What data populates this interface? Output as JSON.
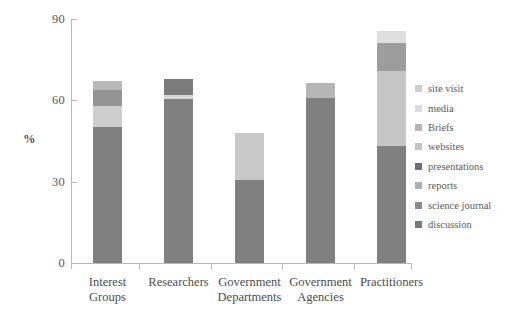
{
  "chart_data": {
    "type": "bar",
    "subtype": "stacked-bar",
    "title": "",
    "xlabel": "",
    "ylabel": "%",
    "ylim": [
      0,
      90
    ],
    "yticks": [
      0,
      30,
      60,
      90
    ],
    "ytick_labels": [
      "0",
      "30",
      "60",
      "90"
    ],
    "grid": false,
    "legend_position": "right",
    "categories": [
      "Interest Groups",
      "Researchers",
      "Government Departments",
      "Government Agencies",
      "Practitioners"
    ],
    "category_lines": [
      [
        "Interest",
        "Groups"
      ],
      [
        "Researchers",
        ""
      ],
      [
        "Government",
        "Departments"
      ],
      [
        "Government",
        "Agencies"
      ],
      [
        "Practitioners",
        ""
      ]
    ],
    "series": [
      {
        "name": "discussion",
        "color": "#808080",
        "values": [
          50,
          60.5,
          30.5,
          61,
          43
        ]
      },
      {
        "name": "science journal",
        "color": "#8c8c8c",
        "values": [
          0,
          0,
          0,
          0,
          0
        ]
      },
      {
        "name": "reports",
        "color": "#a6a6a6",
        "values": [
          0,
          0,
          0,
          0,
          0
        ]
      },
      {
        "name": "presentations",
        "color": "#767676",
        "values": [
          0,
          3,
          0,
          0,
          0
        ]
      },
      {
        "name": "websites",
        "color": "#c9c9c9",
        "values": [
          8,
          0,
          0,
          0,
          0
        ]
      },
      {
        "name": "Briefs",
        "color": "#9b9b9b",
        "values": [
          6,
          3,
          0,
          5.4,
          10
        ]
      },
      {
        "name": "media",
        "color": "#d9d9d9",
        "values": [
          0,
          1.5,
          17.5,
          0,
          28
        ]
      },
      {
        "name": "site visit",
        "color": "#bfbfbf",
        "values": [
          3,
          0,
          0,
          0,
          4.6
        ]
      }
    ],
    "totals": [
      67,
      68,
      48,
      66.4,
      85.6
    ],
    "legend": [
      {
        "label": "site visit",
        "color": "#cfcfcf"
      },
      {
        "label": "media",
        "color": "#dcdcdc"
      },
      {
        "label": "Briefs",
        "color": "#b5b5b5"
      },
      {
        "label": "websites",
        "color": "#c2c2c2"
      },
      {
        "label": "presentations",
        "color": "#6f6f6f"
      },
      {
        "label": "reports",
        "color": "#b0b0b0"
      },
      {
        "label": "science journal",
        "color": "#8a8a8a"
      },
      {
        "label": "discussion",
        "color": "#787878"
      }
    ],
    "stacks": [
      {
        "category": "Interest Groups",
        "segments": [
          {
            "name": "discussion",
            "from": 0,
            "to": 50,
            "color": "#808080"
          },
          {
            "name": "websites",
            "from": 50,
            "to": 58,
            "color": "#cdcdcd"
          },
          {
            "name": "Briefs",
            "from": 58,
            "to": 64,
            "color": "#949494"
          },
          {
            "name": "site visit",
            "from": 64,
            "to": 67,
            "color": "#b9b9b9"
          }
        ]
      },
      {
        "category": "Researchers",
        "segments": [
          {
            "name": "discussion",
            "from": 0,
            "to": 60.5,
            "color": "#808080"
          },
          {
            "name": "media",
            "from": 60.5,
            "to": 62,
            "color": "#d8d8d8"
          },
          {
            "name": "presentations",
            "from": 62,
            "to": 68,
            "color": "#7b7b7b"
          }
        ]
      },
      {
        "category": "Government Departments",
        "segments": [
          {
            "name": "discussion",
            "from": 0,
            "to": 30.5,
            "color": "#808080"
          },
          {
            "name": "media",
            "from": 30.5,
            "to": 48,
            "color": "#c8c8c8"
          }
        ]
      },
      {
        "category": "Government Agencies",
        "segments": [
          {
            "name": "discussion",
            "from": 0,
            "to": 61,
            "color": "#808080"
          },
          {
            "name": "Briefs",
            "from": 61,
            "to": 66.4,
            "color": "#b6b6b6"
          }
        ]
      },
      {
        "category": "Practitioners",
        "segments": [
          {
            "name": "discussion",
            "from": 0,
            "to": 43,
            "color": "#808080"
          },
          {
            "name": "media",
            "from": 43,
            "to": 71,
            "color": "#c6c6c6"
          },
          {
            "name": "Briefs",
            "from": 71,
            "to": 81,
            "color": "#9d9d9d"
          },
          {
            "name": "site visit",
            "from": 81,
            "to": 85.6,
            "color": "#dedede"
          }
        ]
      }
    ]
  },
  "axis": {
    "y_title": "%"
  }
}
